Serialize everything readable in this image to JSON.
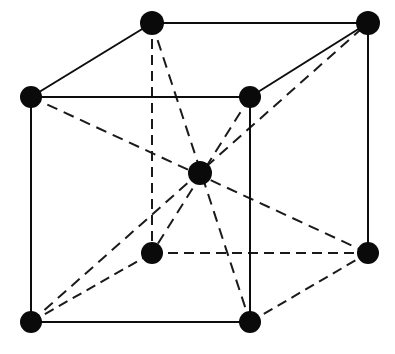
{
  "figure": {
    "type": "crystal-lattice-diagram",
    "background_color": "#ffffff",
    "ink_color": "#0a0a0a",
    "canvas": {
      "width": 395,
      "height": 354
    },
    "atom_radius": 11,
    "line_width": 2,
    "dash_pattern": "10 6"
  },
  "atoms": [
    {
      "id": "front-top-left",
      "label": "corner atom front top left",
      "x": 31,
      "y": 97,
      "r": 11,
      "role": "corner"
    },
    {
      "id": "front-top-right",
      "label": "corner atom front top right",
      "x": 250,
      "y": 97,
      "r": 11,
      "role": "corner"
    },
    {
      "id": "front-bottom-left",
      "label": "corner atom front bottom left",
      "x": 31,
      "y": 322,
      "r": 11,
      "role": "corner"
    },
    {
      "id": "front-bottom-right",
      "label": "corner atom front bottom right",
      "x": 250,
      "y": 322,
      "r": 11,
      "role": "corner"
    },
    {
      "id": "back-top-left",
      "label": "corner atom back top left",
      "x": 152,
      "y": 23,
      "r": 12,
      "role": "corner"
    },
    {
      "id": "back-top-right",
      "label": "corner atom back top right",
      "x": 368,
      "y": 23,
      "r": 12,
      "role": "corner"
    },
    {
      "id": "back-bottom-left",
      "label": "corner atom back bottom left",
      "x": 152,
      "y": 253,
      "r": 11,
      "role": "corner"
    },
    {
      "id": "back-bottom-right",
      "label": "corner atom back bottom right",
      "x": 368,
      "y": 253,
      "r": 11,
      "role": "corner"
    },
    {
      "id": "body-center",
      "label": "body center atom",
      "x": 200,
      "y": 173,
      "r": 12,
      "role": "center"
    }
  ],
  "edges_solid": [
    {
      "id": "front-top",
      "label": "front top edge",
      "x1": 31,
      "y1": 97,
      "x2": 250,
      "y2": 97
    },
    {
      "id": "front-bottom",
      "label": "front bottom edge",
      "x1": 31,
      "y1": 322,
      "x2": 250,
      "y2": 322
    },
    {
      "id": "front-left",
      "label": "front left edge",
      "x1": 31,
      "y1": 97,
      "x2": 31,
      "y2": 322
    },
    {
      "id": "front-right",
      "label": "front right edge",
      "x1": 250,
      "y1": 97,
      "x2": 250,
      "y2": 322
    },
    {
      "id": "back-top",
      "label": "back top edge",
      "x1": 152,
      "y1": 23,
      "x2": 368,
      "y2": 23
    },
    {
      "id": "back-right",
      "label": "back right vertical edge",
      "x1": 368,
      "y1": 23,
      "x2": 368,
      "y2": 253
    },
    {
      "id": "top-left-depth",
      "label": "top left depth edge",
      "x1": 31,
      "y1": 97,
      "x2": 152,
      "y2": 23
    },
    {
      "id": "top-right-depth",
      "label": "top right depth edge",
      "x1": 250,
      "y1": 97,
      "x2": 368,
      "y2": 23
    }
  ],
  "edges_hidden": [
    {
      "id": "back-left-vertical",
      "label": "back left hidden vertical edge",
      "x1": 152,
      "y1": 23,
      "x2": 152,
      "y2": 253
    },
    {
      "id": "back-bottom",
      "label": "back bottom hidden edge",
      "x1": 152,
      "y1": 253,
      "x2": 368,
      "y2": 253
    },
    {
      "id": "bottom-left-depth",
      "label": "bottom left hidden depth edge",
      "x1": 31,
      "y1": 322,
      "x2": 152,
      "y2": 253
    },
    {
      "id": "bottom-right-depth",
      "label": "bottom right hidden depth edge",
      "x1": 250,
      "y1": 322,
      "x2": 368,
      "y2": 253
    }
  ],
  "body_diagonals": [
    {
      "id": "diagonal-ftl-bbr",
      "label": "body diagonal front top left to back bottom right",
      "x1": 31,
      "y1": 97,
      "x2": 368,
      "y2": 253
    },
    {
      "id": "diagonal-fbl-btr",
      "label": "body diagonal front bottom left to back top right",
      "x1": 31,
      "y1": 322,
      "x2": 368,
      "y2": 23
    },
    {
      "id": "diagonal-btl-fbr",
      "label": "body diagonal back top left to front bottom right",
      "x1": 152,
      "y1": 23,
      "x2": 250,
      "y2": 322
    },
    {
      "id": "diagonal-ftr-bbl",
      "label": "body diagonal front top right to back bottom left",
      "x1": 250,
      "y1": 97,
      "x2": 152,
      "y2": 253
    }
  ]
}
